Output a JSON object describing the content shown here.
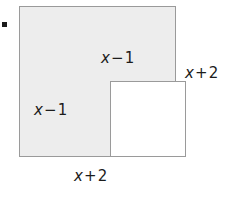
{
  "figure": {
    "type": "geometry-diagram",
    "bullet": {
      "name": "item-marker",
      "shape": "filled-square"
    },
    "colors": {
      "outer_fill": "#ededed",
      "inner_fill": "#ffffff",
      "stroke": "#9a9a9a",
      "text": "#1c1c1c",
      "background": "#ffffff"
    },
    "shapes": {
      "outer_square": {
        "name": "outer-square",
        "fill": "shaded",
        "side_label": "x + 2"
      },
      "inner_square": {
        "name": "inner-square",
        "fill": "white",
        "side_label": "x - 1"
      }
    },
    "labels": {
      "inner_top": {
        "var": "x",
        "op": "−",
        "num": "1",
        "full": "x − 1",
        "position": "above inner square"
      },
      "inner_left": {
        "var": "x",
        "op": "−",
        "num": "1",
        "full": "x − 1",
        "position": "left of inner square"
      },
      "outer_right": {
        "var": "x",
        "op": "+",
        "num": "2",
        "full": "x + 2",
        "position": "right of outer square"
      },
      "outer_bottom": {
        "var": "x",
        "op": "+",
        "num": "2",
        "full": "x + 2",
        "position": "below outer square"
      }
    }
  }
}
